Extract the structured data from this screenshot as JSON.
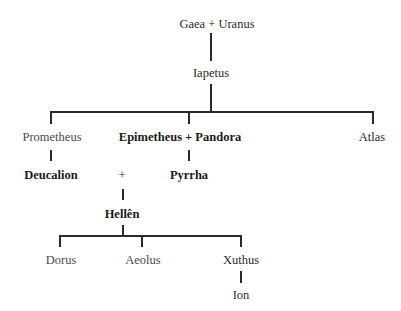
{
  "diagram": {
    "type": "genealogy-tree",
    "nodes": {
      "gaea_uranus": "Gaea + Uranus",
      "iapetus": "Iapetus",
      "prometheus": "Prometheus",
      "epimetheus_pandora": "Epimetheus + Pandora",
      "atlas": "Atlas",
      "deucalion": "Deucalion",
      "plus": "+",
      "pyrrha": "Pyrrha",
      "hellen": "Hellên",
      "dorus": "Dorus",
      "aeolus": "Aeolus",
      "xuthus": "Xuthus",
      "ion": "Ion"
    },
    "edges": [
      [
        "Gaea + Uranus",
        "Iapetus"
      ],
      [
        "Iapetus",
        "Prometheus"
      ],
      [
        "Iapetus",
        "Epimetheus + Pandora"
      ],
      [
        "Iapetus",
        "Atlas"
      ],
      [
        "Prometheus",
        "Deucalion"
      ],
      [
        "Epimetheus + Pandora",
        "Pyrrha"
      ],
      [
        "Deucalion + Pyrrha",
        "Hellên"
      ],
      [
        "Hellên",
        "Dorus"
      ],
      [
        "Hellên",
        "Aeolus"
      ],
      [
        "Hellên",
        "Xuthus"
      ],
      [
        "Xuthus",
        "Ion"
      ]
    ],
    "colors": {
      "line": "#2a2a2a",
      "text": "#2a2a2a",
      "background": "#ffffff"
    }
  }
}
